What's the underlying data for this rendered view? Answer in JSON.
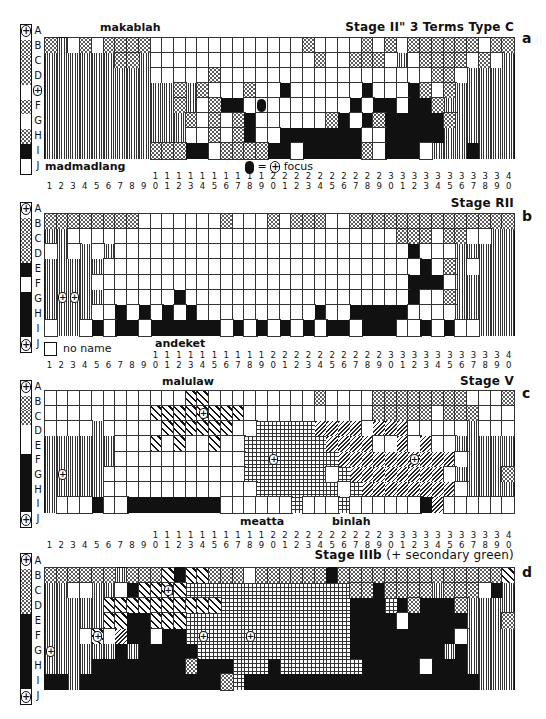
{
  "figure": {
    "rows": [
      "A",
      "B",
      "C",
      "D",
      "E",
      "F",
      "G",
      "H",
      "I",
      "J"
    ],
    "columns": [
      "1",
      "2",
      "3",
      "4",
      "5",
      "6",
      "7",
      "8",
      "9",
      "10",
      "11",
      "12",
      "13",
      "14",
      "15",
      "16",
      "17",
      "18",
      "19",
      "20",
      "21",
      "22",
      "23",
      "24",
      "25",
      "26",
      "27",
      "28",
      "29",
      "30",
      "31",
      "32",
      "33",
      "34",
      "35",
      "36",
      "37",
      "38",
      "39",
      "40"
    ],
    "column_tens": [
      "",
      "",
      "",
      "",
      "",
      "",
      "",
      "",
      "",
      "1",
      "1",
      "1",
      "1",
      "1",
      "1",
      "1",
      "1",
      "1",
      "1",
      "2",
      "2",
      "2",
      "2",
      "2",
      "2",
      "2",
      "2",
      "2",
      "2",
      "3",
      "3",
      "3",
      "3",
      "3",
      "3",
      "3",
      "3",
      "3",
      "3",
      "4"
    ],
    "column_units": [
      "1",
      "2",
      "3",
      "4",
      "5",
      "6",
      "7",
      "8",
      "9",
      "0",
      "1",
      "2",
      "3",
      "4",
      "5",
      "6",
      "7",
      "8",
      "9",
      "0",
      "1",
      "2",
      "3",
      "4",
      "5",
      "6",
      "7",
      "8",
      "9",
      "0",
      "1",
      "2",
      "3",
      "4",
      "5",
      "6",
      "7",
      "8",
      "9",
      "0"
    ],
    "pattern_key": {
      "d": "stippled (dotted)",
      "v": "vertical stripes",
      "b": "black",
      "w": "white / no name",
      "x": "bold diagonal stripes",
      "g": "grid crosshatch",
      "h": "fine diagonal hatching"
    },
    "focus_symbol": "+",
    "focus_legend": "focus",
    "focus_legend_eq": "=",
    "no_name_label": "no name"
  },
  "panels": [
    {
      "id": "a",
      "letter": "a",
      "title": "Stage II\"  3 Terms  Type C",
      "term_labels": [
        {
          "text": "makablah",
          "x": 100,
          "y": 22
        },
        {
          "text": "madmadlang",
          "x": 18,
          "y": 162
        }
      ],
      "legend_segments": [
        "d",
        "d",
        "d",
        "w",
        "d",
        "w",
        "d",
        "b"
      ],
      "legend_top_focus": true,
      "legend_bottom_focus": false,
      "grid": [
        "dvwdwddddwwwwwwwwwwwwwdwwwwdwdwddddddwdd",
        "vvvvvvddvwwwwwwwwwwwwwwdwwdddwvwddddwdwv",
        "vvvvvvvvvwwwwwdwwwwwwwwwwwwwwwwwwddwvvvv",
        "vvvvvvvvvvvdvdwwwdwwbwwwwwwbwwwbdwdvvvvv",
        "vvvvvvvvvvvdvwdbbwwwwwwwwwbwbbwbbdvvvvvv",
        "vvvvvvvvvvvvdwdwdbwwwwwwdbwbdbbbbbdvvvvv",
        "vvvvvvvvvvvvwwdwdbwwbbbbbbbwwbbbbbvvvvvv",
        "vvvvvvvvvdddbbwddddbbwbbbbbdwbbbwvvvbvvv"
      ],
      "focus_cells": [
        {
          "row": "E",
          "col": 0,
          "outside": true
        }
      ],
      "special_markers": [
        {
          "type": "focus-dot",
          "row": "F",
          "col": 18
        }
      ],
      "focus_legend_shown": true
    },
    {
      "id": "b",
      "letter": "b",
      "title": "Stage RII",
      "term_labels": [
        {
          "text": "andeket",
          "x": 155,
          "y": 338
        }
      ],
      "legend_segments": [
        "d",
        "d",
        "d",
        "b",
        "w",
        "b",
        "b",
        "b"
      ],
      "legend_top_focus": true,
      "legend_bottom_focus": true,
      "grid": [
        "ddddddddwwwwwwwdwwwdwdddwwdddddddddddddd",
        "vvwwwwwwwwwwwwwwwwwwwwwwwwwwwwdddwddwwvv",
        "wvwvwvwwwwwwwwwwwwwwwwwwwwwwwwwbwwwvvvvv",
        "vvvvvwwwwwwwwwwwwwwwwwwwwwwwwwwwbwdvwvvv",
        "vvvvwwwwwwwwwwwwwwwwwwwwwwwwwwwbbbwvvvvv",
        "vvvvvwwwwwwbwwwwwwwwwwwwwwwwwwwbwwdvvvvv",
        "vvvvwwbwbwbwbwwwwwwwwwwbwwbbbbbwwwwvvvvv",
        "wvvwbwbbwbbbbbbwbwbwbwbwbbwbbbwwbwbwwvvv"
      ],
      "focus_cells": [
        {
          "row": "G",
          "col": 1
        },
        {
          "row": "G",
          "col": 2
        }
      ],
      "no_name_legend_shown": true
    },
    {
      "id": "c",
      "letter": "c",
      "title": "Stage V",
      "term_labels": [
        {
          "text": "malulaw",
          "x": 162,
          "y": 393
        },
        {
          "text": "meatta",
          "x": 240,
          "y": 517
        },
        {
          "text": "binlah",
          "x": 332,
          "y": 517
        }
      ],
      "legend_segments": [
        "d",
        "d",
        "w",
        "w",
        "b",
        "b",
        "b",
        "b"
      ],
      "legend_top_focus": true,
      "legend_bottom_focus": true,
      "grid": [
        "wwwwwwwwwwwwxxwwwwwwwwwdwwwwddddddddwwwd",
        "wwwwwwwwwxxxxxxxxwwwwwwwwwwwdddddwdddwww",
        "wwwwvwwwwwxxxxxxwwggggghhhhwhhhwwwwwvwww",
        "vvvvvvwwwxwxwwxwwggggggghhhhwwhwhwwvvvvv",
        "vvvvvvwwwwwwwwwwwgggggggghhhhhhhhhhwvvvv",
        "vvvvvwwwwwwwwwwwwgggggggwghhhhhhhhwvvvvd",
        "vvvvvwwwwwwwwwwwwwgggggggwghhhhhhhhwvvvv",
        "vwwwbwwbbbbbbbbwwwwwwgwwwgwwwwwwbhwwwwww"
      ],
      "focus_cells": [
        {
          "row": "C",
          "col": 13
        },
        {
          "row": "G",
          "col": 1
        },
        {
          "row": "F",
          "col": 19
        },
        {
          "row": "F",
          "col": 31
        }
      ]
    },
    {
      "id": "d",
      "letter": "d",
      "title": "Stage IIIb",
      "title_suffix": "(+ secondary green)",
      "term_labels": [],
      "legend_segments": [
        "d",
        "d",
        "d",
        "b",
        "b",
        "b",
        "b",
        "b"
      ],
      "legend_top_focus": true,
      "legend_bottom_focus": true,
      "grid": [
        "ddddddvdddxbxxdddwddddddbddddddddddddddx",
        "vvwwvvwbxxxxggggggggggggggddbddddvdddwbv",
        "vvvvvxxxxxxxxxxgggggggggggbbbgbdbbbdvvvv",
        "vvvvvxxbbxxxggggggggggggggbbbbwbbbbbvvvd",
        "vvvwxwhbbwbbggggggggggggggbbbbbbbbbwvvvv",
        "vvvvvvbvbbbbbgggggggggggggbbbbbbbbvbvvvv",
        "vvvvbbbbbbbbdbbbgggbgggggggbbbbbwbbbvvvv",
        "bbvbbbbbbbbbbbbdgbbbbbbbbbbbbbbbbbbbbvvvv"
      ],
      "focus_cells": [
        {
          "row": "C",
          "col": 10
        },
        {
          "row": "F",
          "col": 4
        },
        {
          "row": "F",
          "col": 13
        },
        {
          "row": "F",
          "col": 17
        },
        {
          "row": "G",
          "col": 0
        }
      ]
    }
  ]
}
